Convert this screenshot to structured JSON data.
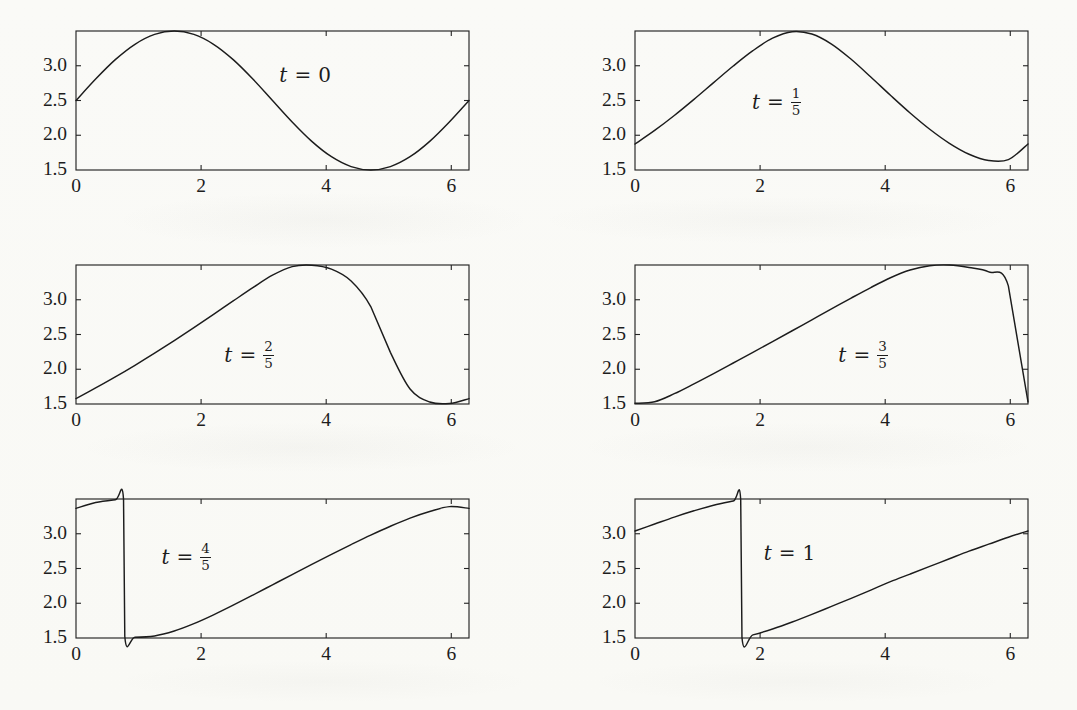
{
  "figure": {
    "kind": "multi-panel-plot",
    "rows": 3,
    "cols": 2,
    "ink_color": "#1c1c1c",
    "page_color": "#fbfbf9"
  },
  "chart_data": [
    {
      "type": "line",
      "title": "t = 0",
      "annotation": "t = 0",
      "annotation_parts": {
        "var": "t",
        "eq": "=",
        "value": "0",
        "numerator": "",
        "denominator": ""
      },
      "xlabel": "",
      "ylabel": "",
      "xlim": [
        0,
        6.283185
      ],
      "ylim": [
        1.5,
        3.5
      ],
      "xticks": [
        0,
        2,
        4,
        6
      ],
      "xtick_labels": [
        "0",
        "2",
        "4",
        "6"
      ],
      "yticks": [
        1.5,
        2.0,
        2.5,
        3.0
      ],
      "ytick_labels": [
        "1.5",
        "2.0",
        "2.5",
        "3.0"
      ],
      "grid": false,
      "legend": "none",
      "t": 0,
      "series": [
        {
          "name": "u(x,0)",
          "x": [
            0,
            0.3142,
            0.6283,
            0.9425,
            1.2566,
            1.5708,
            1.885,
            2.1991,
            2.5133,
            2.8274,
            3.1416,
            3.4558,
            3.7699,
            4.0841,
            4.3982,
            4.7124,
            5.0265,
            5.3407,
            5.6549,
            5.969,
            6.2832
          ],
          "y": [
            2.5,
            2.809,
            3.088,
            3.309,
            3.451,
            3.5,
            3.451,
            3.309,
            3.088,
            2.809,
            2.5,
            2.191,
            1.912,
            1.691,
            1.549,
            1.5,
            1.549,
            1.691,
            1.912,
            2.191,
            2.5
          ]
        }
      ]
    },
    {
      "type": "line",
      "title": "t = 1/5",
      "annotation": "t = 1/5",
      "annotation_parts": {
        "var": "t",
        "eq": "=",
        "value": "",
        "numerator": "1",
        "denominator": "5"
      },
      "xlabel": "",
      "ylabel": "",
      "xlim": [
        0,
        6.283185
      ],
      "ylim": [
        1.5,
        3.5
      ],
      "xticks": [
        0,
        2,
        4,
        6
      ],
      "xtick_labels": [
        "0",
        "2",
        "4",
        "6"
      ],
      "yticks": [
        1.5,
        2.0,
        2.5,
        3.0
      ],
      "ytick_labels": [
        "1.5",
        "2.0",
        "2.5",
        "3.0"
      ],
      "grid": false,
      "legend": "none",
      "t": 0.2,
      "series": [
        {
          "name": "u(x,1/5)",
          "x": [
            0,
            0.3142,
            0.6283,
            0.9425,
            1.2566,
            1.5708,
            1.885,
            2.1991,
            2.5133,
            2.8274,
            3.1416,
            3.4558,
            3.7699,
            4.0841,
            4.3982,
            4.7124,
            5.0265,
            5.3407,
            5.6549,
            5.969,
            6.2832
          ],
          "y": [
            1.874,
            2.069,
            2.284,
            2.516,
            2.757,
            2.996,
            3.217,
            3.397,
            3.49,
            3.456,
            3.312,
            3.093,
            2.838,
            2.575,
            2.32,
            2.086,
            1.884,
            1.727,
            1.636,
            1.649,
            1.874
          ]
        }
      ]
    },
    {
      "type": "line",
      "title": "t = 2/5",
      "annotation": "t = 2/5",
      "annotation_parts": {
        "var": "t",
        "eq": "=",
        "value": "",
        "numerator": "2",
        "denominator": "5"
      },
      "xlabel": "",
      "ylabel": "",
      "xlim": [
        0,
        6.283185
      ],
      "ylim": [
        1.5,
        3.5
      ],
      "xticks": [
        0,
        2,
        4,
        6
      ],
      "xtick_labels": [
        "0",
        "2",
        "4",
        "6"
      ],
      "yticks": [
        1.5,
        2.0,
        2.5,
        3.0
      ],
      "ytick_labels": [
        "1.5",
        "2.0",
        "2.5",
        "3.0"
      ],
      "grid": false,
      "legend": "none",
      "t": 0.4,
      "series": [
        {
          "name": "u(x,2/5)",
          "x": [
            0,
            0.3142,
            0.6283,
            0.9425,
            1.2566,
            1.5708,
            1.885,
            2.1991,
            2.5133,
            2.8274,
            3.1416,
            3.4558,
            3.7699,
            4.0841,
            4.3982,
            4.7124,
            5.0265,
            5.3407,
            5.6549,
            5.969,
            6.2832
          ],
          "y": [
            1.578,
            1.731,
            1.89,
            2.057,
            2.231,
            2.412,
            2.599,
            2.79,
            2.983,
            3.174,
            3.353,
            3.477,
            3.497,
            3.44,
            3.27,
            2.902,
            2.243,
            1.716,
            1.529,
            1.507,
            1.578
          ]
        }
      ]
    },
    {
      "type": "line",
      "title": "t = 3/5",
      "annotation": "t = 3/5",
      "annotation_parts": {
        "var": "t",
        "eq": "=",
        "value": "",
        "numerator": "3",
        "denominator": "5"
      },
      "xlabel": "",
      "ylabel": "",
      "xlim": [
        0,
        6.283185
      ],
      "ylim": [
        1.5,
        3.5
      ],
      "xticks": [
        0,
        2,
        4,
        6
      ],
      "xtick_labels": [
        "0",
        "2",
        "4",
        "6"
      ],
      "yticks": [
        1.5,
        2.0,
        2.5,
        3.0
      ],
      "ytick_labels": [
        "1.5",
        "2.0",
        "2.5",
        "3.0"
      ],
      "grid": false,
      "legend": "none",
      "t": 0.6,
      "series": [
        {
          "name": "u(x,3/5)",
          "x": [
            0,
            0.3142,
            0.6283,
            0.9425,
            1.2566,
            1.5708,
            1.885,
            2.1991,
            2.5133,
            2.8274,
            3.1416,
            3.4558,
            3.7699,
            4.0841,
            4.3982,
            4.7124,
            5.0265,
            5.3407,
            5.6549,
            5.969,
            6.2832
          ],
          "y": [
            1.51,
            1.533,
            1.648,
            1.79,
            1.938,
            2.09,
            2.243,
            2.398,
            2.554,
            2.711,
            2.868,
            3.024,
            3.176,
            3.317,
            3.428,
            3.49,
            3.5,
            3.463,
            3.4,
            3.2,
            1.53
          ]
        }
      ]
    },
    {
      "type": "line",
      "title": "t = 4/5",
      "annotation": "t = 4/5",
      "annotation_parts": {
        "var": "t",
        "eq": "=",
        "value": "",
        "numerator": "4",
        "denominator": "5"
      },
      "xlabel": "",
      "ylabel": "",
      "xlim": [
        0,
        6.283185
      ],
      "ylim": [
        1.5,
        3.5
      ],
      "xticks": [
        0,
        2,
        4,
        6
      ],
      "xtick_labels": [
        "0",
        "2",
        "4",
        "6"
      ],
      "yticks": [
        1.5,
        2.0,
        2.5,
        3.0
      ],
      "ytick_labels": [
        "1.5",
        "2.0",
        "2.5",
        "3.0"
      ],
      "grid": false,
      "legend": "none",
      "t": 0.8,
      "series": [
        {
          "name": "u(x,4/5)",
          "x": [
            0,
            0.3142,
            0.6283,
            0.76,
            0.78,
            0.9425,
            1.2566,
            1.5708,
            1.885,
            2.1991,
            2.5133,
            2.8274,
            3.1416,
            3.4558,
            3.7699,
            4.0841,
            4.3982,
            4.7124,
            5.0265,
            5.3407,
            5.6549,
            5.969,
            6.2832
          ],
          "y": [
            3.365,
            3.45,
            3.49,
            3.495,
            1.525,
            1.512,
            1.53,
            1.6,
            1.706,
            1.833,
            1.972,
            2.117,
            2.265,
            2.413,
            2.56,
            2.704,
            2.844,
            2.98,
            3.108,
            3.225,
            3.32,
            3.39,
            3.365
          ]
        }
      ]
    },
    {
      "type": "line",
      "title": "t = 1",
      "annotation": "t = 1",
      "annotation_parts": {
        "var": "t",
        "eq": "=",
        "value": "1",
        "numerator": "",
        "denominator": ""
      },
      "xlabel": "",
      "ylabel": "",
      "xlim": [
        0,
        6.283185
      ],
      "ylim": [
        1.5,
        3.5
      ],
      "xticks": [
        0,
        2,
        4,
        6
      ],
      "xtick_labels": [
        "0",
        "2",
        "4",
        "6"
      ],
      "yticks": [
        1.5,
        2.0,
        2.5,
        3.0
      ],
      "ytick_labels": [
        "1.5",
        "2.0",
        "2.5",
        "3.0"
      ],
      "grid": false,
      "legend": "none",
      "t": 1.0,
      "series": [
        {
          "name": "u(x,1)",
          "x": [
            0,
            0.3142,
            0.6283,
            0.9425,
            1.2566,
            1.5708,
            1.69,
            1.71,
            1.885,
            2.1991,
            2.5133,
            2.8274,
            3.1416,
            3.4558,
            3.7699,
            4.0841,
            4.3982,
            4.7124,
            5.0265,
            5.3407,
            5.6549,
            5.969,
            6.2832
          ],
          "y": [
            3.04,
            3.14,
            3.24,
            3.33,
            3.41,
            3.47,
            3.49,
            1.51,
            1.545,
            1.63,
            1.73,
            1.84,
            1.955,
            2.07,
            2.19,
            2.31,
            2.42,
            2.53,
            2.64,
            2.75,
            2.85,
            2.95,
            3.04
          ]
        }
      ]
    }
  ],
  "panels": [
    {
      "index": 0,
      "row": 0,
      "col": 0,
      "annotation_x": 0.52,
      "annotation_y": 0.33
    },
    {
      "index": 1,
      "row": 0,
      "col": 1,
      "annotation_x": 0.3,
      "annotation_y": 0.5
    },
    {
      "index": 2,
      "row": 1,
      "col": 0,
      "annotation_x": 0.38,
      "annotation_y": 0.64
    },
    {
      "index": 3,
      "row": 1,
      "col": 1,
      "annotation_x": 0.52,
      "annotation_y": 0.64
    },
    {
      "index": 4,
      "row": 2,
      "col": 0,
      "annotation_x": 0.22,
      "annotation_y": 0.41
    },
    {
      "index": 5,
      "row": 2,
      "col": 1,
      "annotation_x": 0.33,
      "annotation_y": 0.4
    }
  ]
}
